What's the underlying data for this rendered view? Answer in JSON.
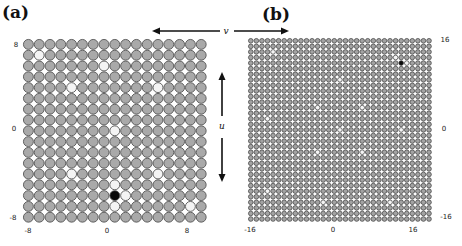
{
  "panels": [
    {
      "id": "a",
      "label": "(a)",
      "grid_size": 17,
      "range": [
        -8,
        8
      ],
      "x_ticks": [
        "-8",
        "0",
        "8"
      ],
      "y_ticks": [
        "8",
        "0",
        "-8"
      ],
      "origin": {
        "x": 23,
        "y": 39
      },
      "pitch": 10.8,
      "colors": {
        "site": "#a9a9a9",
        "outline": "#555555",
        "vacancy": "#f4f4f4",
        "defect": "#0a0a0a"
      },
      "white_sites": [
        [
          1,
          1
        ],
        [
          7,
          2
        ],
        [
          4,
          4
        ],
        [
          12,
          4
        ],
        [
          8,
          8
        ],
        [
          4,
          12
        ],
        [
          12,
          12
        ],
        [
          8,
          13
        ],
        [
          9,
          14
        ],
        [
          8,
          15
        ],
        [
          15,
          15
        ]
      ],
      "black_sites": [
        [
          8,
          14
        ]
      ]
    },
    {
      "id": "b",
      "label": "(b)",
      "grid_size": 33,
      "range": [
        -16,
        16
      ],
      "x_ticks": [
        "-16",
        "0",
        "16"
      ],
      "y_ticks": [
        "16",
        "0",
        "-16"
      ],
      "origin": {
        "x": 248,
        "y": 38
      },
      "pitch": 5.57,
      "colors": {
        "site": "#a3a3a3",
        "outline": "#3a3a3a",
        "vacancy": "#f4f4f4",
        "defect": "#0a0a0a"
      },
      "white_sites": [
        [
          4,
          2
        ],
        [
          26,
          3
        ],
        [
          28,
          4
        ],
        [
          16,
          7
        ],
        [
          12,
          12
        ],
        [
          20,
          12
        ],
        [
          3,
          14
        ],
        [
          16,
          16
        ],
        [
          27,
          16
        ],
        [
          12,
          20
        ],
        [
          20,
          20
        ],
        [
          3,
          27
        ],
        [
          13,
          29
        ],
        [
          25,
          29
        ]
      ],
      "black_sites": [
        [
          27,
          4
        ]
      ]
    }
  ],
  "axes": {
    "v_label": "v",
    "u_label": "u"
  }
}
